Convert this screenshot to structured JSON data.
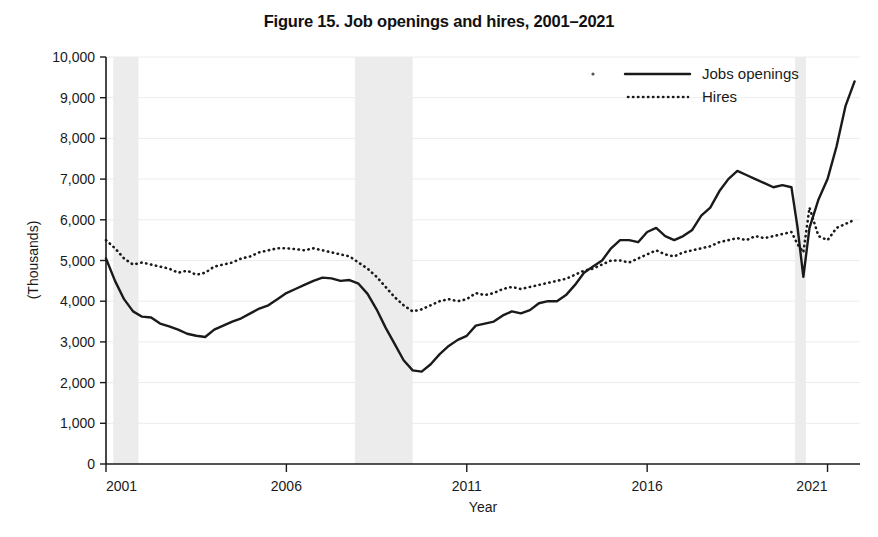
{
  "figure": {
    "title": "Figure 15.  Job openings and hires, 2001–2021",
    "xlabel": "Year",
    "ylabel": "(Thousands)"
  },
  "legend": {
    "position": "top-right",
    "entries": [
      {
        "label": "Jobs openings",
        "style": "solid"
      },
      {
        "label": "Hires",
        "style": "dotted"
      }
    ]
  },
  "axes": {
    "y_ticks": [
      "0",
      "1,000",
      "2,000",
      "3,000",
      "4,000",
      "5,000",
      "6,000",
      "7,000",
      "8,000",
      "9,000",
      "10,000"
    ],
    "x_ticks": [
      "2001",
      "2006",
      "2011",
      "2016",
      "2021"
    ]
  },
  "colors": {
    "line": "#1a1a1a",
    "recession_shading": "#ececec",
    "gridline": "#ececec",
    "background": "#ffffff"
  },
  "chart_data": {
    "type": "line",
    "title": "Figure 15.  Job openings and hires, 2001–2021",
    "xlabel": "Year",
    "ylabel": "(Thousands)",
    "units": "Thousands",
    "grid": true,
    "legend_position": "top right",
    "xlim": [
      2001,
      2021.9
    ],
    "ylim": [
      0,
      10000
    ],
    "y_tick_values": [
      0,
      1000,
      2000,
      3000,
      4000,
      5000,
      6000,
      7000,
      8000,
      9000,
      10000
    ],
    "x_tick_values": [
      2001,
      2006,
      2011,
      2016,
      2021
    ],
    "shaded_regions": [
      {
        "label": "2001 recession",
        "start": 2001.2,
        "end": 2001.9
      },
      {
        "label": "Great Recession",
        "start": 2007.9,
        "end": 2009.5
      },
      {
        "label": "COVID-19 recession",
        "start": 2020.1,
        "end": 2020.4
      }
    ],
    "series": [
      {
        "name": "Jobs openings",
        "style": "solid",
        "x": [
          2001.0,
          2001.25,
          2001.5,
          2001.75,
          2002.0,
          2002.25,
          2002.5,
          2002.75,
          2003.0,
          2003.25,
          2003.5,
          2003.75,
          2004.0,
          2004.25,
          2004.5,
          2004.75,
          2005.0,
          2005.25,
          2005.5,
          2005.75,
          2006.0,
          2006.25,
          2006.5,
          2006.75,
          2007.0,
          2007.25,
          2007.5,
          2007.75,
          2008.0,
          2008.25,
          2008.5,
          2008.75,
          2009.0,
          2009.25,
          2009.5,
          2009.75,
          2010.0,
          2010.25,
          2010.5,
          2010.75,
          2011.0,
          2011.25,
          2011.5,
          2011.75,
          2012.0,
          2012.25,
          2012.5,
          2012.75,
          2013.0,
          2013.25,
          2013.5,
          2013.75,
          2014.0,
          2014.25,
          2014.5,
          2014.75,
          2015.0,
          2015.25,
          2015.5,
          2015.75,
          2016.0,
          2016.25,
          2016.5,
          2016.75,
          2017.0,
          2017.25,
          2017.5,
          2017.75,
          2018.0,
          2018.25,
          2018.5,
          2018.75,
          2019.0,
          2019.25,
          2019.5,
          2019.75,
          2020.0,
          2020.17,
          2020.33,
          2020.5,
          2020.75,
          2021.0,
          2021.25,
          2021.5,
          2021.75
        ],
        "values": [
          5050,
          4500,
          4050,
          3750,
          3620,
          3600,
          3450,
          3380,
          3300,
          3200,
          3150,
          3120,
          3300,
          3400,
          3500,
          3580,
          3700,
          3820,
          3900,
          4050,
          4200,
          4300,
          4400,
          4500,
          4580,
          4560,
          4500,
          4520,
          4430,
          4180,
          3800,
          3350,
          2950,
          2550,
          2300,
          2270,
          2450,
          2700,
          2900,
          3050,
          3150,
          3400,
          3450,
          3500,
          3650,
          3750,
          3700,
          3780,
          3950,
          4000,
          4000,
          4150,
          4400,
          4700,
          4850,
          5000,
          5300,
          5500,
          5500,
          5450,
          5700,
          5800,
          5600,
          5500,
          5600,
          5750,
          6100,
          6300,
          6700,
          7000,
          7200,
          7100,
          7000,
          6900,
          6800,
          6850,
          6800,
          5800,
          4600,
          5800,
          6500,
          7000,
          7800,
          8800,
          9400
        ]
      },
      {
        "name": "Hires",
        "style": "dotted",
        "x": [
          2001.0,
          2001.25,
          2001.5,
          2001.75,
          2002.0,
          2002.25,
          2002.5,
          2002.75,
          2003.0,
          2003.25,
          2003.5,
          2003.75,
          2004.0,
          2004.25,
          2004.5,
          2004.75,
          2005.0,
          2005.25,
          2005.5,
          2005.75,
          2006.0,
          2006.25,
          2006.5,
          2006.75,
          2007.0,
          2007.25,
          2007.5,
          2007.75,
          2008.0,
          2008.25,
          2008.5,
          2008.75,
          2009.0,
          2009.25,
          2009.5,
          2009.75,
          2010.0,
          2010.25,
          2010.5,
          2010.75,
          2011.0,
          2011.25,
          2011.5,
          2011.75,
          2012.0,
          2012.25,
          2012.5,
          2012.75,
          2013.0,
          2013.25,
          2013.5,
          2013.75,
          2014.0,
          2014.25,
          2014.5,
          2014.75,
          2015.0,
          2015.25,
          2015.5,
          2015.75,
          2016.0,
          2016.25,
          2016.5,
          2016.75,
          2017.0,
          2017.25,
          2017.5,
          2017.75,
          2018.0,
          2018.25,
          2018.5,
          2018.75,
          2019.0,
          2019.25,
          2019.5,
          2019.75,
          2020.0,
          2020.17,
          2020.33,
          2020.5,
          2020.75,
          2021.0,
          2021.25,
          2021.5,
          2021.75
        ],
        "values": [
          5500,
          5300,
          5050,
          4900,
          4950,
          4900,
          4850,
          4800,
          4700,
          4750,
          4650,
          4700,
          4850,
          4900,
          4950,
          5050,
          5100,
          5200,
          5250,
          5300,
          5300,
          5280,
          5250,
          5300,
          5250,
          5200,
          5150,
          5100,
          4950,
          4800,
          4600,
          4350,
          4100,
          3900,
          3750,
          3800,
          3900,
          4000,
          4050,
          4000,
          4050,
          4200,
          4150,
          4200,
          4300,
          4350,
          4300,
          4350,
          4400,
          4450,
          4500,
          4550,
          4650,
          4750,
          4800,
          4900,
          5000,
          5000,
          4950,
          5050,
          5150,
          5250,
          5150,
          5100,
          5200,
          5250,
          5300,
          5350,
          5450,
          5500,
          5550,
          5500,
          5600,
          5550,
          5600,
          5650,
          5700,
          5400,
          5200,
          6300,
          5600,
          5500,
          5800,
          5900,
          6000
        ]
      }
    ]
  }
}
